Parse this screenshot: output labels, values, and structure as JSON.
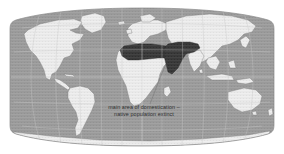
{
  "figure": {
    "type": "thematic-world-map",
    "projection": "Robinson",
    "background_color": "#ffffff",
    "width": 284,
    "height": 154
  },
  "caption": {
    "line1": "main area of domestication –",
    "line2": "native population extinct",
    "text_color": "#2e2e2e"
  },
  "legend": {
    "highlight_label": "main area of domestication – native population extinct",
    "highlight_color": "#3a3a3a",
    "land_color": "#e9e9e9",
    "ocean_color": "#9a9a9a",
    "graticule_color": "#c9c9c9",
    "coastline_color": "#787878"
  },
  "regions": {
    "highlighted": [
      "North Africa",
      "Sahara",
      "Egypt",
      "Arabian Peninsula",
      "Levant",
      "Mesopotamia",
      "Iran"
    ],
    "land_masses": [
      "North America",
      "South America",
      "Greenland",
      "Europe",
      "Africa",
      "Asia",
      "Australia",
      "Antarctica"
    ]
  },
  "graticule": {
    "parallels_deg": [
      -60,
      -30,
      0,
      30,
      60
    ],
    "meridians_deg": [
      -150,
      -120,
      -90,
      -60,
      -30,
      0,
      30,
      60,
      90,
      120,
      150
    ],
    "equator_deg": 0,
    "grid_visible": true
  }
}
